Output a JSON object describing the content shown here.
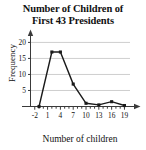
{
  "chart_data": {
    "type": "line",
    "title": "Number of Children of First 43 Presidents",
    "title_line1": "Number of Children of",
    "title_line2": "First 43 Presidents",
    "xlabel": "Number of children",
    "ylabel": "Frequency",
    "x": [
      -1,
      2,
      4,
      7,
      10,
      13,
      16,
      19
    ],
    "values": [
      0,
      17,
      17,
      7,
      1,
      0.5,
      1.5,
      0.3
    ],
    "series": [
      {
        "name": "Frequency",
        "points": [
          {
            "x": -1,
            "y": 0
          },
          {
            "x": 2,
            "y": 17
          },
          {
            "x": 4,
            "y": 17
          },
          {
            "x": 7,
            "y": 7
          },
          {
            "x": 10,
            "y": 1
          },
          {
            "x": 13,
            "y": 0.5
          },
          {
            "x": 16,
            "y": 1.5
          },
          {
            "x": 19,
            "y": 0.3
          }
        ]
      }
    ],
    "xlim": [
      -3,
      21
    ],
    "ylim": [
      0,
      22
    ],
    "x_tick_labels": [
      "-2",
      "1",
      "4",
      "7",
      "10",
      "13",
      "16",
      "19"
    ],
    "x_tick_values": [
      -2,
      1,
      4,
      7,
      10,
      13,
      16,
      19
    ],
    "x_minor_tick_interval": 1,
    "y_tick_labels": [
      "5",
      "10",
      "15",
      "20"
    ],
    "y_tick_values": [
      5,
      10,
      15,
      20
    ],
    "grid": "horizontal",
    "legend": "none",
    "line_color": "#1a1a1a",
    "marker": "square",
    "marker_color": "#1a1a1a",
    "grid_color": "#b9b9b9",
    "axis_color": "#3a3a3a",
    "background": "#ffffff"
  }
}
